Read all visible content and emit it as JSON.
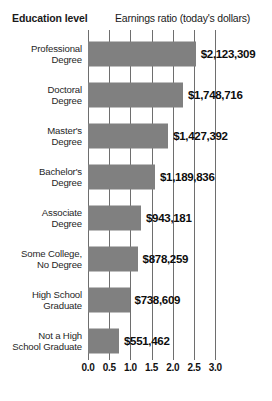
{
  "header": {
    "left_label": "Education level",
    "right_label": "Earnings ratio (today's dollars)"
  },
  "axis": {
    "ticks": [
      "0.0",
      "0.5",
      "1.0",
      "1.5",
      "2.0",
      "2.5",
      "3.0"
    ]
  },
  "rows": [
    {
      "label_line1": "Professional",
      "label_line2": "Degree",
      "value_label": "$2,123,309"
    },
    {
      "label_line1": "Doctoral",
      "label_line2": "Degree",
      "value_label": "$1,748,716"
    },
    {
      "label_line1": "Master's",
      "label_line2": "Degree",
      "value_label": "$1,427,392"
    },
    {
      "label_line1": "Bachelor's",
      "label_line2": "Degree",
      "value_label": "$1,189,836"
    },
    {
      "label_line1": "Associate",
      "label_line2": "Degree",
      "value_label": "$943,181"
    },
    {
      "label_line1": "Some College,",
      "label_line2": "No Degree",
      "value_label": "$878,259"
    },
    {
      "label_line1": "High School",
      "label_line2": "Graduate",
      "value_label": "$738,609"
    },
    {
      "label_line1": "Not a High",
      "label_line2": "School Graduate",
      "value_label": "$551,462"
    }
  ],
  "colors": {
    "bar_fill": "#808080",
    "gridline": "#6e6e6e",
    "text": "#1a1a1a",
    "background": "#ffffff"
  },
  "chart_data": {
    "type": "bar",
    "orientation": "horizontal",
    "title": "",
    "xlabel": "Earnings ratio (today's dollars)",
    "ylabel": "Education level",
    "categories": [
      "Professional Degree",
      "Doctoral Degree",
      "Master's Degree",
      "Bachelor's Degree",
      "Associate Degree",
      "Some College, No Degree",
      "High School Graduate",
      "Not a High School Graduate"
    ],
    "values": [
      2.54,
      2.24,
      1.89,
      1.58,
      1.25,
      1.17,
      0.98,
      0.73
    ],
    "value_labels": [
      "$2,123,309",
      "$1,748,716",
      "$1,427,392",
      "$1,189,836",
      "$943,181",
      "$878,259",
      "$738,609",
      "$551,462"
    ],
    "earnings": [
      2123309,
      1748716,
      1427392,
      1189836,
      943181,
      878259,
      738609,
      551462
    ],
    "xlim": [
      0.0,
      3.0
    ],
    "xticks": [
      0.0,
      0.5,
      1.0,
      1.5,
      2.0,
      2.5,
      3.0
    ],
    "xtick_labels": [
      "0.0",
      "0.5",
      "1.0",
      "1.5",
      "2.0",
      "2.5",
      "3.0"
    ],
    "grid": "vertical",
    "legend": "none",
    "series": [
      {
        "name": "Earnings ratio",
        "values": [
          2.54,
          2.24,
          1.89,
          1.58,
          1.25,
          1.17,
          0.98,
          0.73
        ]
      }
    ]
  }
}
